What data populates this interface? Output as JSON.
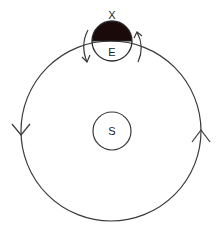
{
  "diagram": {
    "type": "orbit-diagram",
    "labels": {
      "sun": "S",
      "earth": "E",
      "point": "X"
    },
    "colors": {
      "line": "#3a3a3a",
      "shaded_half": "#1a0a0a",
      "background": "#ffffff"
    },
    "orbit": {
      "direction": "counterclockwise",
      "arrows": [
        "left-side-down",
        "right-side-up"
      ]
    },
    "earth_rotation": {
      "direction": "counterclockwise",
      "shaded": "top-half (night side facing away from S)"
    }
  }
}
